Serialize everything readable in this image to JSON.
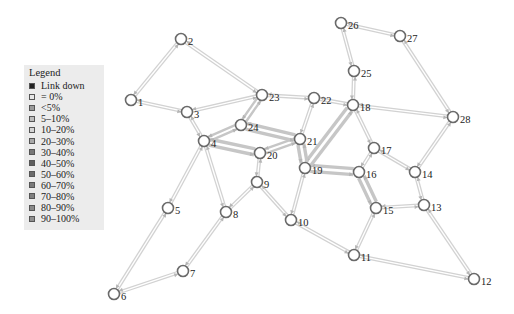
{
  "legend": {
    "title": "Legend",
    "items": [
      {
        "label": "Link down",
        "color": "#222222"
      },
      {
        "label": "= 0%",
        "color": "#e6e6e6"
      },
      {
        "label": "<5%",
        "color": "#9a9a9a"
      },
      {
        "label": "5–10%",
        "color": "#bdbdbd"
      },
      {
        "label": "10–20%",
        "color": "#d4d4d4"
      },
      {
        "label": "20–30%",
        "color": "#a8a8a8"
      },
      {
        "label": "30–40%",
        "color": "#777777"
      },
      {
        "label": "40–50%",
        "color": "#5e5e5e"
      },
      {
        "label": "50–60%",
        "color": "#6a6a6a"
      },
      {
        "label": "60–70%",
        "color": "#7a7a7a"
      },
      {
        "label": "70–80%",
        "color": "#808080"
      },
      {
        "label": "80–90%",
        "color": "#8a8a8a"
      },
      {
        "label": "90–100%",
        "color": "#909090"
      }
    ]
  },
  "nodes": [
    {
      "id": "1",
      "x": 131,
      "y": 100
    },
    {
      "id": "2",
      "x": 181,
      "y": 39
    },
    {
      "id": "3",
      "x": 187,
      "y": 112
    },
    {
      "id": "4",
      "x": 204,
      "y": 141
    },
    {
      "id": "5",
      "x": 168,
      "y": 208
    },
    {
      "id": "6",
      "x": 114,
      "y": 294
    },
    {
      "id": "7",
      "x": 183,
      "y": 271
    },
    {
      "id": "8",
      "x": 226,
      "y": 212
    },
    {
      "id": "9",
      "x": 257,
      "y": 182
    },
    {
      "id": "10",
      "x": 291,
      "y": 220
    },
    {
      "id": "11",
      "x": 354,
      "y": 255
    },
    {
      "id": "12",
      "x": 474,
      "y": 279
    },
    {
      "id": "13",
      "x": 424,
      "y": 205
    },
    {
      "id": "14",
      "x": 415,
      "y": 172
    },
    {
      "id": "15",
      "x": 376,
      "y": 208
    },
    {
      "id": "16",
      "x": 359,
      "y": 172
    },
    {
      "id": "17",
      "x": 374,
      "y": 148
    },
    {
      "id": "18",
      "x": 353,
      "y": 105
    },
    {
      "id": "19",
      "x": 305,
      "y": 168
    },
    {
      "id": "20",
      "x": 260,
      "y": 153
    },
    {
      "id": "21",
      "x": 300,
      "y": 139
    },
    {
      "id": "22",
      "x": 314,
      "y": 98
    },
    {
      "id": "23",
      "x": 262,
      "y": 95
    },
    {
      "id": "24",
      "x": 241,
      "y": 125
    },
    {
      "id": "25",
      "x": 354,
      "y": 71
    },
    {
      "id": "26",
      "x": 341,
      "y": 23
    },
    {
      "id": "27",
      "x": 400,
      "y": 36
    },
    {
      "id": "28",
      "x": 453,
      "y": 117
    }
  ],
  "links": [
    {
      "a": "1",
      "b": "2",
      "w": 1
    },
    {
      "a": "1",
      "b": "3",
      "w": 1
    },
    {
      "a": "2",
      "b": "23",
      "w": 1
    },
    {
      "a": "3",
      "b": "23",
      "w": 1
    },
    {
      "a": "3",
      "b": "4",
      "w": 1
    },
    {
      "a": "4",
      "b": "5",
      "w": 1
    },
    {
      "a": "4",
      "b": "8",
      "w": 1
    },
    {
      "a": "4",
      "b": "24",
      "w": 2
    },
    {
      "a": "4",
      "b": "20",
      "w": 3
    },
    {
      "a": "5",
      "b": "6",
      "w": 1
    },
    {
      "a": "6",
      "b": "7",
      "w": 1
    },
    {
      "a": "7",
      "b": "8",
      "w": 1
    },
    {
      "a": "8",
      "b": "9",
      "w": 1
    },
    {
      "a": "9",
      "b": "20",
      "w": 1
    },
    {
      "a": "9",
      "b": "10",
      "w": 1
    },
    {
      "a": "10",
      "b": "19",
      "w": 1
    },
    {
      "a": "10",
      "b": "11",
      "w": 1
    },
    {
      "a": "11",
      "b": "15",
      "w": 1
    },
    {
      "a": "11",
      "b": "12",
      "w": 1
    },
    {
      "a": "12",
      "b": "13",
      "w": 1
    },
    {
      "a": "13",
      "b": "15",
      "w": 1
    },
    {
      "a": "13",
      "b": "14",
      "w": 1
    },
    {
      "a": "14",
      "b": "17",
      "w": 1
    },
    {
      "a": "14",
      "b": "28",
      "w": 1
    },
    {
      "a": "15",
      "b": "16",
      "w": 3
    },
    {
      "a": "16",
      "b": "17",
      "w": 1
    },
    {
      "a": "16",
      "b": "19",
      "w": 3
    },
    {
      "a": "17",
      "b": "18",
      "w": 1
    },
    {
      "a": "18",
      "b": "19",
      "w": 3
    },
    {
      "a": "18",
      "b": "22",
      "w": 1
    },
    {
      "a": "18",
      "b": "25",
      "w": 1
    },
    {
      "a": "18",
      "b": "28",
      "w": 1
    },
    {
      "a": "19",
      "b": "21",
      "w": 3
    },
    {
      "a": "20",
      "b": "21",
      "w": 2
    },
    {
      "a": "21",
      "b": "24",
      "w": 3
    },
    {
      "a": "21",
      "b": "22",
      "w": 1
    },
    {
      "a": "22",
      "b": "23",
      "w": 1
    },
    {
      "a": "23",
      "b": "24",
      "w": 2
    },
    {
      "a": "25",
      "b": "26",
      "w": 1
    },
    {
      "a": "26",
      "b": "27",
      "w": 1
    },
    {
      "a": "27",
      "b": "28",
      "w": 1
    }
  ]
}
